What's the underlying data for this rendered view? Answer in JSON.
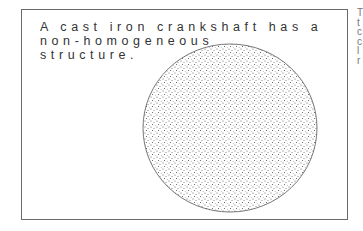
{
  "caption": {
    "lines": [
      "A cast iron crankshaft has a",
      "non-homogeneous",
      "structure."
    ]
  },
  "side_text": {
    "lines": [
      "T",
      "t",
      "c",
      "c",
      "l",
      "r"
    ]
  },
  "figure": {
    "shape": "circle",
    "fill": "stippled",
    "stroke": "#555555"
  }
}
